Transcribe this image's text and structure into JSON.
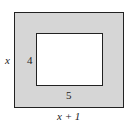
{
  "diagram": {
    "outer_rect": {
      "height_label": "x",
      "width_label": "x + 1",
      "fill": "#d6d6d6"
    },
    "inner_rect": {
      "height_label": "4",
      "width_label": "5",
      "fill": "#ffffff"
    }
  }
}
